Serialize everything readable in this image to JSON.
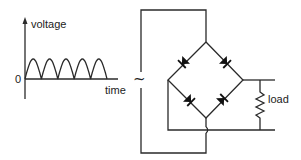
{
  "graph": {
    "y_axis_label": "voltage",
    "x_axis_label": "time",
    "origin_label": "0",
    "waveform": "full-wave rectified",
    "pulse_count": 5
  },
  "circuit": {
    "source_symbol": "~",
    "load_label": "load",
    "diode_count": 4,
    "type": "bridge rectifier"
  }
}
